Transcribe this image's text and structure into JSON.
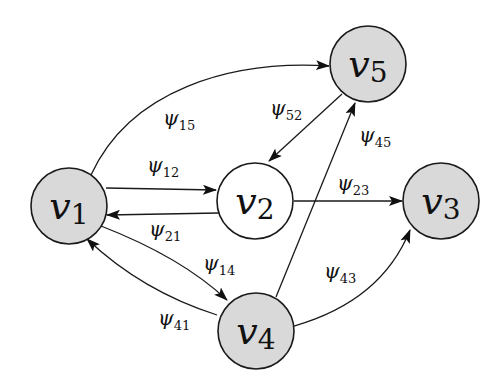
{
  "diagram": {
    "type": "directed-graph",
    "colors": {
      "node_fill_shaded": "#d9d9d9",
      "node_fill_plain": "#ffffff",
      "stroke": "#1a1a1a"
    },
    "nodes": [
      {
        "id": "v1",
        "base": "v",
        "sub": "1",
        "shaded": true
      },
      {
        "id": "v2",
        "base": "v",
        "sub": "2",
        "shaded": false
      },
      {
        "id": "v3",
        "base": "v",
        "sub": "3",
        "shaded": true
      },
      {
        "id": "v4",
        "base": "v",
        "sub": "4",
        "shaded": true
      },
      {
        "id": "v5",
        "base": "v",
        "sub": "5",
        "shaded": true
      }
    ],
    "edges": [
      {
        "from": "v1",
        "to": "v5",
        "base": "ψ",
        "sub": "15"
      },
      {
        "from": "v1",
        "to": "v2",
        "base": "ψ",
        "sub": "12"
      },
      {
        "from": "v2",
        "to": "v1",
        "base": "ψ",
        "sub": "21"
      },
      {
        "from": "v1",
        "to": "v4",
        "base": "ψ",
        "sub": "14"
      },
      {
        "from": "v4",
        "to": "v1",
        "base": "ψ",
        "sub": "41"
      },
      {
        "from": "v5",
        "to": "v2",
        "base": "ψ",
        "sub": "52"
      },
      {
        "from": "v4",
        "to": "v5",
        "base": "ψ",
        "sub": "45"
      },
      {
        "from": "v2",
        "to": "v3",
        "base": "ψ",
        "sub": "23"
      },
      {
        "from": "v4",
        "to": "v3",
        "base": "ψ",
        "sub": "43"
      }
    ]
  }
}
